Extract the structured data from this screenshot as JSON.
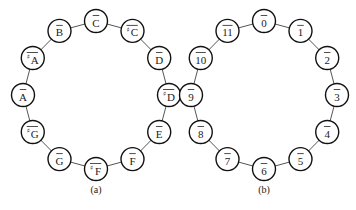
{
  "diagrams": [
    {
      "id": "a",
      "caption": "(a)",
      "center": [
        96,
        95
      ],
      "rx": 73,
      "ry": 74,
      "nodes": [
        {
          "label": "C",
          "sharp": false
        },
        {
          "label": "C",
          "sharp": true
        },
        {
          "label": "D",
          "sharp": false
        },
        {
          "label": "D",
          "sharp": true
        },
        {
          "label": "E",
          "sharp": false
        },
        {
          "label": "F",
          "sharp": false
        },
        {
          "label": "F",
          "sharp": true
        },
        {
          "label": "G",
          "sharp": false
        },
        {
          "label": "G",
          "sharp": true
        },
        {
          "label": "A",
          "sharp": false
        },
        {
          "label": "A",
          "sharp": true
        },
        {
          "label": "B",
          "sharp": false
        }
      ]
    },
    {
      "id": "b",
      "caption": "(b)",
      "center": [
        264,
        95
      ],
      "rx": 73,
      "ry": 74,
      "nodes": [
        {
          "label": "0",
          "sharp": false
        },
        {
          "label": "1",
          "sharp": false
        },
        {
          "label": "2",
          "sharp": false
        },
        {
          "label": "3",
          "sharp": false
        },
        {
          "label": "4",
          "sharp": false
        },
        {
          "label": "5",
          "sharp": false
        },
        {
          "label": "6",
          "sharp": false
        },
        {
          "label": "7",
          "sharp": false
        },
        {
          "label": "8",
          "sharp": false
        },
        {
          "label": "9",
          "sharp": false
        },
        {
          "label": "10",
          "sharp": false
        },
        {
          "label": "11",
          "sharp": false
        }
      ]
    }
  ],
  "style": {
    "node_radius": 11.5,
    "sharp_symbol": "♯",
    "caption_y": 193
  }
}
